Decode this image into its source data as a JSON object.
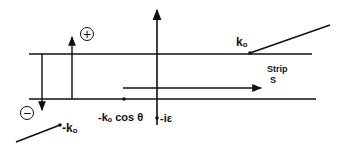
{
  "diagram": {
    "stroke_color": "#111111",
    "background": "#ffffff",
    "labels": {
      "plus": "+",
      "minus": "−",
      "k0_base": "k",
      "k0_sub": "o",
      "neg_k0_prefix": "-k",
      "neg_k0_sub": "o",
      "kcos_prefix": "-k",
      "kcos_sub": "o",
      "kcos_suffix": " cos θ",
      "neg_i_eps": "-iε",
      "strip_line1": "Strip",
      "strip_line2": "S"
    }
  }
}
